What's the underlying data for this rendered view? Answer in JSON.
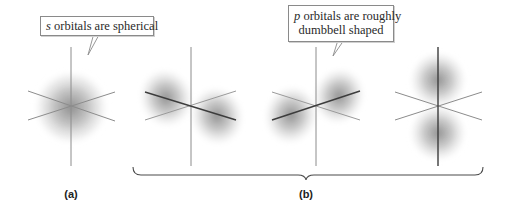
{
  "figure": {
    "callouts": {
      "s_orbitals": {
        "italic": "s",
        "text": " orbitals are spherical"
      },
      "p_orbitals": {
        "italic": "p",
        "line1": " orbitals are roughly",
        "line2": "dumbbell shaped"
      }
    },
    "panels": [
      {
        "id": "a",
        "label": "(a)",
        "orbital": "s",
        "shape": "sphere"
      },
      {
        "id": "b",
        "label": "(b)",
        "orbitals": [
          "p-x",
          "p-y",
          "p-z"
        ],
        "shape": "dumbbell"
      }
    ],
    "colors": {
      "axis": "#8c8c8c",
      "axis_dark": "#3c3c3c",
      "orbital_shading": "#6e6e6e",
      "callout_border": "#8a8a8a",
      "brace": "#4a4a4a"
    }
  }
}
